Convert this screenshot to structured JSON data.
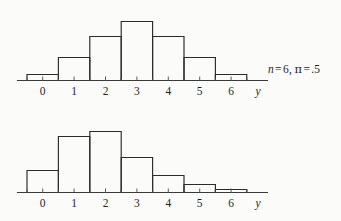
{
  "chart_data": [
    {
      "type": "bar",
      "title": "",
      "subtitle": "",
      "annotation": "n = 6, π = .5",
      "annotation_parts": {
        "n_symbol": "n",
        "n_value": "6",
        "pi_symbol": "π",
        "pi_value": ".5"
      },
      "categories": [
        "0",
        "1",
        "2",
        "3",
        "4",
        "5",
        "6"
      ],
      "values": [
        0.0156,
        0.0938,
        0.2344,
        0.3125,
        0.2344,
        0.0938,
        0.0156
      ],
      "bar_pixel_heights": [
        6,
        23,
        44,
        59,
        44,
        23,
        6
      ],
      "xlabel": "y",
      "ylabel": "",
      "ylim": [
        0,
        0.35
      ],
      "grid": false,
      "legend": false
    },
    {
      "type": "bar",
      "title": "",
      "subtitle": "",
      "annotation": "n = 6, π = .3",
      "annotation_parts": {
        "n_symbol": "n",
        "n_value": "6",
        "pi_symbol": "π",
        "pi_value": ".3"
      },
      "categories": [
        "0",
        "1",
        "2",
        "3",
        "4",
        "5",
        "6"
      ],
      "values": [
        0.1176,
        0.3025,
        0.3241,
        0.1852,
        0.0595,
        0.0102,
        0.0007
      ],
      "bar_pixel_heights": [
        22,
        56,
        61,
        35,
        17,
        8,
        3
      ],
      "xlabel": "y",
      "ylabel": "",
      "ylim": [
        0,
        0.35
      ],
      "grid": false,
      "legend": false
    }
  ]
}
